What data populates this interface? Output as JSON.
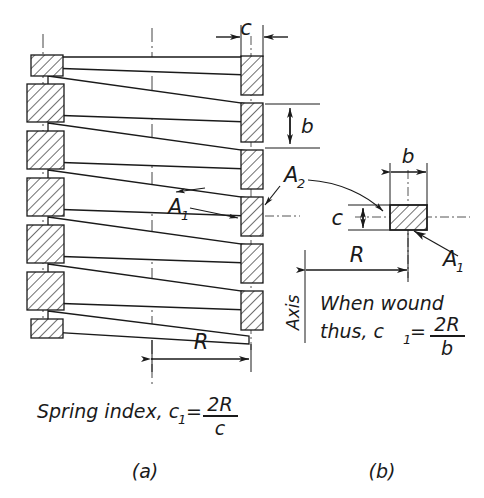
{
  "figure": {
    "title_text": "Spring index and coil cross-section diagram",
    "panel_a": {
      "caption": "(a)",
      "formula_prefix": "Spring index, c",
      "formula_sub": "1",
      "formula_eq": "=",
      "formula_numerator": "2R",
      "formula_denominator": "c",
      "dim_c": "c",
      "dim_b": "b",
      "dim_R": "R",
      "callout_a1": "A",
      "callout_a1_sub": "1",
      "callout_a2": "A",
      "callout_a2_sub": "2"
    },
    "panel_b": {
      "caption": "(b)",
      "axis_label": "Axis",
      "note_line1": "When wound",
      "note_line2_prefix": "thus, c",
      "note_line2_sub": "1",
      "note_line2_eq": "=",
      "note_numerator": "2R",
      "note_denominator": "b",
      "dim_b": "b",
      "dim_c": "c",
      "dim_R": "R",
      "callout_a1": "A",
      "callout_a1_sub": "1"
    },
    "colors": {
      "ink": "#1a1a1a",
      "background": "#ffffff",
      "centerline": "#444444"
    }
  }
}
